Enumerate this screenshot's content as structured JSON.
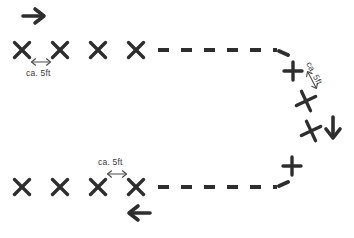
{
  "diagram": {
    "background_color": "#ffffff",
    "ink_color": "#2e2e2e",
    "labels": {
      "top_spacing": "ca. 5ft",
      "bottom_spacing": "ca. 5ft",
      "right_spacing": "ca. 5ft"
    },
    "markers": {
      "top_row": [
        {
          "name": "marker-top-1",
          "x": 22,
          "y": 50,
          "glyph": "x",
          "rotation": 0
        },
        {
          "name": "marker-top-2",
          "x": 60,
          "y": 50,
          "glyph": "x",
          "rotation": 0
        },
        {
          "name": "marker-top-3",
          "x": 98,
          "y": 50,
          "glyph": "x",
          "rotation": 0
        },
        {
          "name": "marker-top-4",
          "x": 136,
          "y": 50,
          "glyph": "x",
          "rotation": 0
        }
      ],
      "right_curve": [
        {
          "name": "marker-curve-1",
          "x": 293,
          "y": 71,
          "glyph": "plus",
          "rotation": 0
        },
        {
          "name": "marker-curve-2",
          "x": 306,
          "y": 101,
          "glyph": "x",
          "rotation": 20
        },
        {
          "name": "marker-curve-3",
          "x": 311,
          "y": 131,
          "glyph": "x",
          "rotation": 20
        },
        {
          "name": "marker-curve-4",
          "x": 292,
          "y": 166,
          "glyph": "plus",
          "rotation": 0
        }
      ],
      "bottom_row": [
        {
          "name": "marker-bottom-1",
          "x": 22,
          "y": 187,
          "glyph": "x",
          "rotation": 0
        },
        {
          "name": "marker-bottom-2",
          "x": 60,
          "y": 187,
          "glyph": "x",
          "rotation": 0
        },
        {
          "name": "marker-bottom-3",
          "x": 98,
          "y": 187,
          "glyph": "x",
          "rotation": 0
        },
        {
          "name": "marker-bottom-4",
          "x": 136,
          "y": 187,
          "glyph": "x",
          "rotation": 0
        }
      ]
    },
    "arrows": [
      {
        "name": "direction-arrow-start",
        "x": 34,
        "y": 16,
        "direction": "right"
      },
      {
        "name": "direction-arrow-descend",
        "x": 333,
        "y": 128,
        "direction": "down"
      },
      {
        "name": "direction-arrow-return",
        "x": 139,
        "y": 213,
        "direction": "left"
      }
    ],
    "dash_runs": {
      "top": {
        "name": "dashed-path-top",
        "from_x": 158,
        "to_x": 282,
        "y": 50
      },
      "bottom": {
        "name": "dashed-path-bottom",
        "from_x": 158,
        "to_x": 282,
        "y": 187
      }
    },
    "spacing_arrows": [
      {
        "name": "spacing-arrow-top",
        "x": 41,
        "y": 62,
        "orientation": "horizontal"
      },
      {
        "name": "spacing-arrow-bottom",
        "x": 117,
        "y": 174,
        "orientation": "horizontal"
      },
      {
        "name": "spacing-arrow-right",
        "x": 312,
        "y": 78,
        "orientation": "diagonal"
      }
    ]
  }
}
